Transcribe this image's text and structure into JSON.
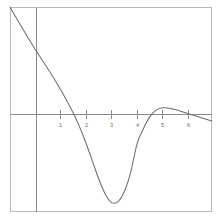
{
  "chart_data": {
    "type": "line",
    "title": "",
    "subtitle": "",
    "xlabel": "",
    "ylabel": "",
    "xlim": [
      -1.0,
      6.95
    ],
    "ylim": [
      -2.03,
      4.07
    ],
    "grid": false,
    "legend": null,
    "axis_color": "#8a8a8a",
    "frame_color": "#b9b9b9",
    "curve_color": "#6e6e6e",
    "xticks": [
      1,
      2,
      3,
      4,
      5,
      6
    ],
    "xtick_labels": [
      "1",
      "2",
      "3",
      "4",
      "5",
      "6"
    ],
    "yticks": [],
    "ytick_labels": [],
    "series": [
      {
        "name": "curve",
        "color": "#6e6e6e",
        "x": [
          -1.0,
          -0.75,
          -0.5,
          -0.25,
          0.0,
          0.25,
          0.5,
          0.75,
          1.0,
          1.25,
          1.5,
          1.75,
          2.0,
          2.25,
          2.5,
          2.75,
          3.0,
          3.25,
          3.5,
          3.75,
          4.0,
          4.25,
          4.5,
          4.75,
          5.0,
          5.25,
          5.5,
          5.75,
          6.0,
          6.25,
          6.5,
          6.75,
          6.95
        ],
        "y": [
          4.07,
          3.74,
          3.42,
          3.1,
          2.8,
          2.51,
          2.22,
          1.92,
          1.6,
          1.26,
          0.9,
          0.48,
          0.0,
          -0.53,
          -1.06,
          -1.5,
          -1.75,
          -1.72,
          -1.42,
          -0.85,
          0.0,
          0.45,
          0.8,
          1.0,
          1.07,
          1.06,
          1.02,
          0.96,
          0.9,
          0.84,
          0.78,
          0.72,
          0.68
        ]
      }
    ],
    "annotations": []
  },
  "figure": {
    "width": 219,
    "height": 221,
    "background": "#ffffff",
    "frame": {
      "left": 10,
      "top": 7,
      "right": 212,
      "bottom": 212
    },
    "axes": {
      "x_axis_y": 114,
      "y_axis_x": 36
    }
  }
}
